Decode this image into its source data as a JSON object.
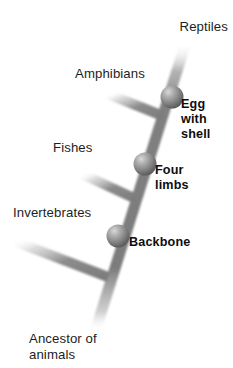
{
  "diagram": {
    "type": "cladogram",
    "background_color": "#ffffff",
    "branch_color": "#7e7e7e",
    "node_color": "#6f6f6f",
    "text_color": "#1d1d1d",
    "taxa": [
      {
        "id": "reptiles",
        "label": "Reptiles",
        "position": "top-right-tip"
      },
      {
        "id": "amphibians",
        "label": "Amphibians",
        "position": "branch-left-1"
      },
      {
        "id": "fishes",
        "label": "Fishes",
        "position": "branch-left-2"
      },
      {
        "id": "invertebrates",
        "label": "Invertebrates",
        "position": "branch-left-3"
      }
    ],
    "traits": [
      {
        "id": "egg-with-shell",
        "label": "Egg\nwith\nshell",
        "lines": [
          "Egg",
          "with",
          "shell"
        ],
        "node": 1
      },
      {
        "id": "four-limbs",
        "label": "Four\nlimbs",
        "lines": [
          "Four",
          "limbs"
        ],
        "node": 2
      },
      {
        "id": "backbone",
        "label": "Backbone",
        "lines": [
          "Backbone"
        ],
        "node": 3
      }
    ],
    "root": {
      "id": "ancestor",
      "lines": [
        "Ancestor of",
        "animals"
      ],
      "line1": "Ancestor of",
      "line2": "animals"
    }
  }
}
